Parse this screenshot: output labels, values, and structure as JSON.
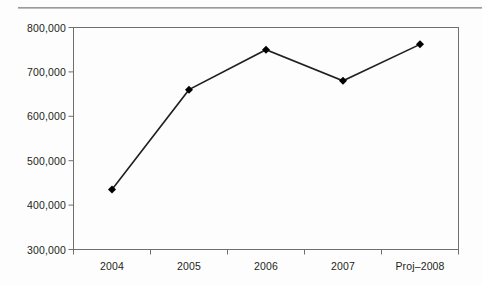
{
  "chart_data": {
    "type": "line",
    "title": "",
    "subtitle": "",
    "xlabel": "",
    "ylabel": "",
    "categories": [
      "2004",
      "2005",
      "2006",
      "2007",
      "Proj–2008"
    ],
    "values": [
      435000,
      660000,
      750000,
      680000,
      762000
    ],
    "series": [
      {
        "name": "",
        "values": [
          435000,
          660000,
          750000,
          680000,
          762000
        ]
      }
    ],
    "ylim": [
      300000,
      800000
    ],
    "ytick_values": [
      300000,
      400000,
      500000,
      600000,
      700000,
      800000
    ],
    "ytick_labels": [
      "300,000",
      "400,000",
      "500,000",
      "600,000",
      "700,000",
      "800,000"
    ],
    "xtick_labels": [
      "2004",
      "2005",
      "2006",
      "2007",
      "Proj–2008"
    ],
    "grid": false,
    "legend": false,
    "legend_position": "none",
    "marker": "diamond",
    "line_color": "#231f20",
    "marker_color": "#000000",
    "axis_color": "#6f6f71",
    "text_color": "#231f20",
    "background_color": "#fdfdfd",
    "annotations": []
  },
  "figure": {
    "top_rule_color": "#8d8d8f"
  }
}
